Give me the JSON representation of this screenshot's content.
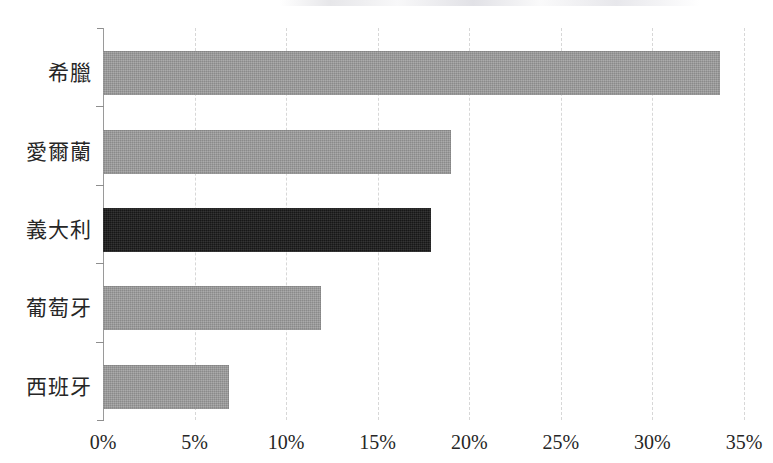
{
  "chart_data": {
    "type": "bar",
    "orientation": "horizontal",
    "title": "",
    "xlabel": "",
    "ylabel": "",
    "categories": [
      "希臘",
      "愛爾蘭",
      "義大利",
      "葡萄牙",
      "西班牙"
    ],
    "values": [
      33.7,
      19.0,
      17.9,
      11.9,
      6.9
    ],
    "value_format": "percent",
    "xlim": [
      0,
      35
    ],
    "xticks": [
      0,
      5,
      10,
      15,
      20,
      25,
      30,
      35
    ],
    "xtick_labels": [
      "0%",
      "5%",
      "10%",
      "15%",
      "20%",
      "25%",
      "30%",
      "35%"
    ],
    "grid": true,
    "grid_axis": "x",
    "grid_style": "dashed",
    "legend": false,
    "highlight_category": "義大利",
    "bars": [
      {
        "category": "希臘",
        "value": 33.7,
        "label": "33.7%",
        "highlighted": false
      },
      {
        "category": "愛爾蘭",
        "value": 19.0,
        "label": "19.0%",
        "highlighted": false
      },
      {
        "category": "義大利",
        "value": 17.9,
        "label": "17.9%",
        "highlighted": true
      },
      {
        "category": "葡萄牙",
        "value": 11.9,
        "label": "11.9%",
        "highlighted": false
      },
      {
        "category": "西班牙",
        "value": 6.9,
        "label": "6.9%",
        "highlighted": false
      }
    ],
    "colors": {
      "bar_default": "#969696",
      "bar_highlight": "#1e1e1e",
      "gridline": "#d7d7d7",
      "axis": "#8e8e8e",
      "text": "#262626",
      "background": "#ffffff"
    }
  }
}
